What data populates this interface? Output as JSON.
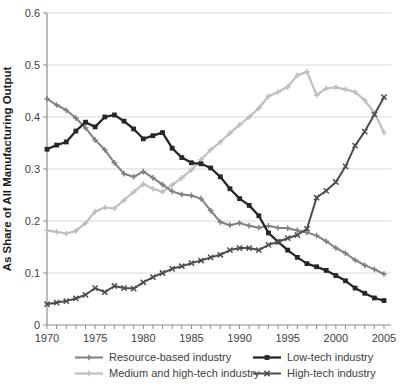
{
  "chart_data": {
    "type": "line",
    "title": "",
    "xlabel": "",
    "ylabel": "As Share of All Manufacturing Output",
    "ylim": [
      0,
      0.6
    ],
    "yticks": [
      0,
      0.1,
      0.2,
      0.3,
      0.4,
      0.5,
      0.6
    ],
    "ytick_labels": [
      "0",
      "0.1",
      "0.2",
      "0.3",
      "0.4",
      "0.5",
      "0.6"
    ],
    "x_range": [
      1970,
      2005
    ],
    "xtick_labels": [
      "1970",
      "1975",
      "1980",
      "1985",
      "1990",
      "1995",
      "2000",
      "2005"
    ],
    "xticks_labeled": [
      1970,
      1975,
      1980,
      1985,
      1990,
      1995,
      2000,
      2005
    ],
    "grid": "horizontal",
    "legend_position": "bottom",
    "x": [
      1970,
      1971,
      1972,
      1973,
      1974,
      1975,
      1976,
      1977,
      1978,
      1979,
      1980,
      1981,
      1982,
      1983,
      1984,
      1985,
      1986,
      1987,
      1988,
      1989,
      1990,
      1991,
      1992,
      1993,
      1994,
      1995,
      1996,
      1997,
      1998,
      1999,
      2000,
      2001,
      2002,
      2003,
      2004,
      2005
    ],
    "series": [
      {
        "name": "Resource-based industry",
        "color": "#808080",
        "marker": "plus",
        "values": [
          0.435,
          0.423,
          0.413,
          0.398,
          0.379,
          0.356,
          0.337,
          0.312,
          0.291,
          0.285,
          0.295,
          0.283,
          0.27,
          0.257,
          0.251,
          0.249,
          0.243,
          0.22,
          0.198,
          0.192,
          0.196,
          0.191,
          0.187,
          0.191,
          0.187,
          0.186,
          0.182,
          0.178,
          0.172,
          0.161,
          0.148,
          0.138,
          0.125,
          0.115,
          0.107,
          0.098
        ]
      },
      {
        "name": "Low-tech industry",
        "color": "#262626",
        "marker": "square",
        "values": [
          0.338,
          0.346,
          0.352,
          0.373,
          0.39,
          0.381,
          0.4,
          0.404,
          0.392,
          0.377,
          0.358,
          0.364,
          0.37,
          0.34,
          0.322,
          0.312,
          0.31,
          0.302,
          0.285,
          0.262,
          0.243,
          0.23,
          0.21,
          0.177,
          0.16,
          0.144,
          0.13,
          0.118,
          0.112,
          0.105,
          0.095,
          0.085,
          0.071,
          0.061,
          0.052,
          0.047
        ]
      },
      {
        "name": "Medium and high-tech industry",
        "color": "#bfbfbf",
        "marker": "plus",
        "values": [
          0.182,
          0.179,
          0.176,
          0.181,
          0.196,
          0.218,
          0.226,
          0.224,
          0.24,
          0.256,
          0.271,
          0.262,
          0.256,
          0.269,
          0.283,
          0.298,
          0.318,
          0.337,
          0.352,
          0.369,
          0.385,
          0.4,
          0.417,
          0.44,
          0.448,
          0.458,
          0.48,
          0.487,
          0.442,
          0.455,
          0.457,
          0.453,
          0.448,
          0.432,
          0.408,
          0.37
        ]
      },
      {
        "name": "High-tech industry",
        "color": "#4d4d4d",
        "marker": "x",
        "values": [
          0.04,
          0.043,
          0.046,
          0.051,
          0.058,
          0.071,
          0.063,
          0.075,
          0.071,
          0.07,
          0.082,
          0.092,
          0.1,
          0.108,
          0.113,
          0.119,
          0.124,
          0.13,
          0.135,
          0.144,
          0.148,
          0.148,
          0.144,
          0.154,
          0.16,
          0.167,
          0.173,
          0.185,
          0.245,
          0.258,
          0.275,
          0.305,
          0.345,
          0.372,
          0.405,
          0.438
        ]
      }
    ],
    "draw_order": [
      2,
      0,
      1,
      3
    ]
  },
  "style": {
    "grid_color": "#d9d9d9",
    "axis_color": "#8c8c8c",
    "tick_label_color": "#404040",
    "legend_text_color": "#404040"
  }
}
